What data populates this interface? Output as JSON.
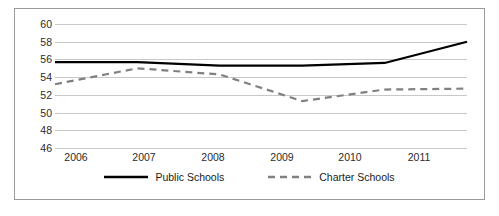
{
  "chart_data": {
    "type": "line",
    "title": "",
    "subtitle": "",
    "xlabel": "",
    "ylabel": "",
    "categories": [
      "2006",
      "2007",
      "2008",
      "2009",
      "2010",
      "2011"
    ],
    "ylim": [
      46,
      60
    ],
    "yticks": [
      46,
      48,
      50,
      52,
      54,
      56,
      58,
      60
    ],
    "ytick_labels": [
      "46",
      "48",
      "50",
      "52",
      "54",
      "56",
      "58",
      "60"
    ],
    "grid": "horizontal",
    "legend_position": "bottom",
    "series": [
      {
        "name": "Public Schools",
        "style": "solid",
        "color": "#000000",
        "values": [
          55.7,
          55.7,
          55.3,
          55.3,
          55.6,
          58.0
        ]
      },
      {
        "name": "Charter Schools",
        "style": "dashed",
        "color": "#808080",
        "values": [
          53.2,
          55.0,
          54.3,
          51.3,
          52.6,
          52.7
        ]
      }
    ]
  },
  "legend": {
    "entries": [
      {
        "label": "Public Schools"
      },
      {
        "label": "Charter Schools"
      }
    ]
  },
  "axis": {
    "y_labels": [
      "60",
      "58",
      "56",
      "54",
      "52",
      "50",
      "48",
      "46"
    ],
    "x_labels": [
      "2006",
      "2007",
      "2008",
      "2009",
      "2010",
      "2011"
    ]
  },
  "colors": {
    "public": "#000000",
    "charter": "#808080",
    "gridline": "#c8c8c8",
    "border": "#9a9a9a",
    "text": "#2b2b2b"
  }
}
